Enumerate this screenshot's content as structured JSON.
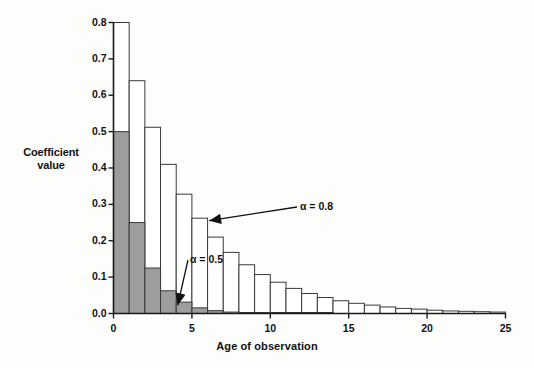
{
  "chart_data": {
    "type": "bar",
    "title": "",
    "xlabel": "Age of observation",
    "ylabel": "Coefficient value",
    "ylabel_line1": "Coefficient",
    "ylabel_line2": "value",
    "xlim": [
      0,
      25
    ],
    "ylim": [
      0.0,
      0.8
    ],
    "grid": false,
    "legend_position": "inline-annotations",
    "y_ticks": [
      "0.0",
      "0.1",
      "0.2",
      "0.3",
      "0.4",
      "0.5",
      "0.6",
      "0.7",
      "0.8"
    ],
    "y_tick_values": [
      0.0,
      0.1,
      0.2,
      0.3,
      0.4,
      0.5,
      0.6,
      0.7,
      0.8
    ],
    "x_ticks": [
      "0",
      "5",
      "10",
      "15",
      "20",
      "25"
    ],
    "x_tick_values": [
      0,
      5,
      10,
      15,
      20,
      25
    ],
    "x": [
      0,
      1,
      2,
      3,
      4,
      5,
      6,
      7,
      8,
      9,
      10,
      11,
      12,
      13,
      14,
      15,
      16,
      17,
      18,
      19,
      20,
      21,
      22,
      23,
      24
    ],
    "series": [
      {
        "name": "alpha = 0.8",
        "annotation": "α = 0.8",
        "style": "white-fill-black-outline",
        "fill": "#ffffff",
        "stroke": "#3a3a3a",
        "values": [
          0.8,
          0.64,
          0.512,
          0.41,
          0.328,
          0.262,
          0.21,
          0.168,
          0.134,
          0.107,
          0.086,
          0.069,
          0.055,
          0.044,
          0.035,
          0.028,
          0.023,
          0.018,
          0.014,
          0.012,
          0.009,
          0.007,
          0.006,
          0.005,
          0.004
        ]
      },
      {
        "name": "alpha = 0.5",
        "annotation": "α = 0.5",
        "style": "gray-fill-black-outline",
        "fill": "#9d9d9d",
        "stroke": "#3a3a3a",
        "values": [
          0.5,
          0.25,
          0.125,
          0.0625,
          0.0313,
          0.0156,
          0.0078,
          0.0039,
          0.002,
          0.001,
          0.0005,
          0.0002,
          0.0001,
          0.0001,
          0.0,
          0.0,
          0.0,
          0.0,
          0.0,
          0.0,
          0.0,
          0.0,
          0.0,
          0.0,
          0.0
        ]
      }
    ],
    "annotations": [
      {
        "text": "α = 0.8",
        "points_to_x": 6,
        "points_to_y": 0.262
      },
      {
        "text": "α = 0.5",
        "points_to_x": 4,
        "points_to_y": 0.031
      }
    ]
  },
  "colors": {
    "background": "#fdfdfc",
    "axis": "#1a1a1a",
    "bar_outline": "#3a3a3a",
    "bar_gray_fill": "#9d9d9d",
    "bar_white_fill": "#ffffff",
    "text": "#111111"
  }
}
